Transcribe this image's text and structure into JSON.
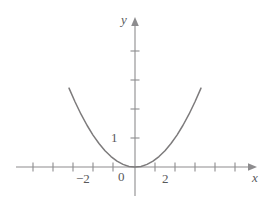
{
  "figure": {
    "background_color": "#ffffff",
    "curve_color": "#7d7b7c",
    "axis_color": "#8d8c8e",
    "text_color": "#58595b"
  },
  "chart_data": {
    "type": "line",
    "title": "",
    "xlabel": "x",
    "ylabel": "y",
    "function": "y = x^2/4",
    "grid": false,
    "legend": false,
    "xlim": [
      -3.9,
      4.4
    ],
    "ylim": [
      -0.75,
      4.7
    ],
    "x_axis": {
      "label": "x",
      "arrow": true,
      "tick_labels": [
        "-2",
        "2"
      ],
      "tick_label_values": [
        -2,
        2
      ],
      "ticks": [
        -3,
        -2,
        -1,
        1,
        2,
        3,
        4
      ],
      "axis_screen_y": 167
    },
    "y_axis": {
      "label": "y",
      "arrow": true,
      "tick_labels": [
        "1"
      ],
      "tick_label_values": [
        1
      ],
      "ticks": [
        1,
        2,
        3,
        4
      ],
      "axis_screen_x": 135
    },
    "origin_label": "0",
    "x": [
      -3.3,
      -3.0,
      -2.7,
      -2.4,
      -2.1,
      -1.8,
      -1.5,
      -1.2,
      -0.9,
      -0.6,
      -0.3,
      0.0,
      0.3,
      0.6,
      0.9,
      1.2,
      1.5,
      1.8,
      2.1,
      2.4,
      2.7,
      3.0,
      3.3
    ],
    "y": [
      2.72,
      2.25,
      1.82,
      1.44,
      1.1,
      0.81,
      0.56,
      0.36,
      0.2,
      0.09,
      0.02,
      0.0,
      0.02,
      0.09,
      0.2,
      0.36,
      0.56,
      0.81,
      1.1,
      1.44,
      1.82,
      2.25,
      2.72
    ],
    "series": [
      {
        "name": "y = x^2/4",
        "x": [
          -3.3,
          -3.0,
          -2.7,
          -2.4,
          -2.1,
          -1.8,
          -1.5,
          -1.2,
          -0.9,
          -0.6,
          -0.3,
          0.0,
          0.3,
          0.6,
          0.9,
          1.2,
          1.5,
          1.8,
          2.1,
          2.4,
          2.7,
          3.0,
          3.3
        ],
        "values": [
          2.72,
          2.25,
          1.82,
          1.44,
          1.1,
          0.81,
          0.56,
          0.36,
          0.2,
          0.09,
          0.02,
          0.0,
          0.02,
          0.09,
          0.2,
          0.36,
          0.56,
          0.81,
          1.1,
          1.44,
          1.82,
          2.25,
          2.72
        ]
      }
    ]
  },
  "labels": {
    "y_axis": "y",
    "x_axis": "x",
    "origin": "0",
    "x_neg_two": "−2",
    "x_pos_two": "2",
    "y_one": "1"
  }
}
